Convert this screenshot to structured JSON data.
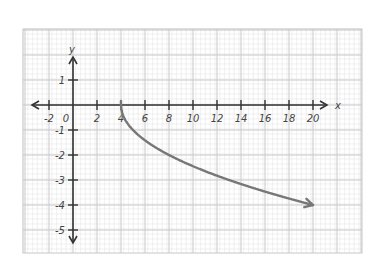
{
  "chart_data": {
    "type": "line",
    "title": "",
    "xlabel": "x",
    "ylabel": "y",
    "function": "y = -sqrt(x - 4)",
    "xlim": [
      -3,
      24
    ],
    "ylim": [
      -6,
      3
    ],
    "grid": true,
    "x_ticks": [
      -2,
      0,
      2,
      4,
      6,
      8,
      10,
      12,
      14,
      16,
      18,
      20
    ],
    "x_tick_labels": [
      "-2",
      "0",
      "2",
      "4",
      "6",
      "8",
      "10",
      "12",
      "14",
      "16",
      "18",
      "20"
    ],
    "y_ticks": [
      1,
      -1,
      -2,
      -3,
      -4,
      -5
    ],
    "y_tick_labels": [
      "1",
      "-1",
      "-2",
      "-3",
      "-4",
      "-5"
    ],
    "series": [
      {
        "name": "y = -√(x-4)",
        "x": [
          4,
          4.25,
          5,
          6,
          8,
          10,
          12,
          14,
          16,
          18,
          20
        ],
        "y": [
          0,
          -0.5,
          -1,
          -1.41,
          -2,
          -2.45,
          -2.83,
          -3.16,
          -3.46,
          -3.74,
          -4
        ],
        "start_point": [
          4,
          0
        ],
        "end_arrow": [
          20,
          -4
        ],
        "color": "#777777"
      }
    ],
    "legend": null
  },
  "colors": {
    "axis": "#333333",
    "grid_major": "#c8c8c8",
    "grid_minor": "#e6e6e6",
    "curve": "#777777"
  }
}
